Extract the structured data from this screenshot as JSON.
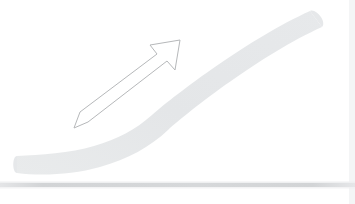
{
  "figure": {
    "background_color": "#ffffff",
    "width": 355,
    "height": 204,
    "alt_text": "A pale grey band curving upward from lower left to upper right above a grey horizontal baseline, with a thin outlined arrow pointing up and to the right."
  },
  "chart_data": {
    "type": "line",
    "xlabel": "",
    "ylabel": "",
    "xlim": [
      0,
      355
    ],
    "ylim": [
      0,
      204
    ],
    "grid": false,
    "legend": "none",
    "series": [
      {
        "name": "growth-ramp",
        "kind": "thick-band",
        "color": "#e6e8ea",
        "band_thickness": 14,
        "x": [
          17,
          45,
          80,
          110,
          135,
          155,
          180,
          215,
          250,
          285,
          316
        ],
        "y": [
          163,
          163,
          160,
          153,
          145,
          138,
          123,
          100,
          77,
          53,
          28
        ]
      },
      {
        "name": "baseline",
        "kind": "horizontal-rule",
        "color": "#d2d4d6",
        "x": [
          0,
          355
        ],
        "y": [
          185,
          185
        ],
        "thickness": 4
      }
    ],
    "annotations": [
      {
        "name": "direction-arrow",
        "kind": "outlined-arrow",
        "stroke": "#b6b8ba",
        "fill": "#ffffff",
        "stroke_width": 1,
        "from": [
          73,
          121
        ],
        "to": [
          178,
          43
        ],
        "shaft_width": 14,
        "head_width": 34,
        "head_length": 26,
        "direction_degrees": 36.6
      }
    ]
  },
  "colors": {
    "band": "#e6e8ea",
    "band_edge": "#eef0f1",
    "baseline": "#d2d4d6",
    "baseline_soft": "#e9eaec",
    "arrow_stroke": "#b6b8ba",
    "arrow_fill": "#ffffff",
    "background": "#ffffff",
    "right_edge": "#f2f3f4"
  }
}
